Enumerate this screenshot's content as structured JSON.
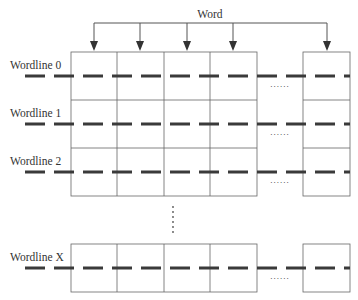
{
  "diagram": {
    "word_label": "Word",
    "wordlines": [
      {
        "label": "Wordline 0",
        "y": 76
      },
      {
        "label": "Wordline 1",
        "y": 124
      },
      {
        "label": "Wordline 2",
        "y": 172
      },
      {
        "label": "Wordline X",
        "y": 268
      }
    ],
    "ellipsis_horizontal": "......",
    "ellipsis_vertical": "......",
    "colors": {
      "line": "#555555",
      "dash": "#3a3a3a",
      "text": "#333333",
      "background": "#ffffff"
    }
  }
}
